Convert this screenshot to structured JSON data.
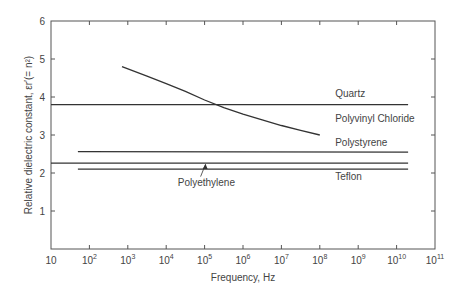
{
  "chart_data": {
    "type": "line",
    "title": "",
    "xlabel": "Frequency, Hz",
    "ylabel": "Relative dielectric constant, εr′(= n²)",
    "xscale": "log",
    "xlim": [
      10,
      100000000000
    ],
    "ylim": [
      0,
      6
    ],
    "grid": false,
    "legend": "inline labels",
    "x_ticks": [
      {
        "value": 1,
        "label": "10",
        "sup": ""
      },
      {
        "value": 2,
        "label": "10",
        "sup": "2"
      },
      {
        "value": 3,
        "label": "10",
        "sup": "3"
      },
      {
        "value": 4,
        "label": "10",
        "sup": "4"
      },
      {
        "value": 5,
        "label": "10",
        "sup": "5"
      },
      {
        "value": 6,
        "label": "10",
        "sup": "6"
      },
      {
        "value": 7,
        "label": "10",
        "sup": "7"
      },
      {
        "value": 8,
        "label": "10",
        "sup": "8"
      },
      {
        "value": 9,
        "label": "10",
        "sup": "9"
      },
      {
        "value": 10,
        "label": "10",
        "sup": "10"
      },
      {
        "value": 11,
        "label": "10",
        "sup": "11"
      }
    ],
    "y_ticks": [
      {
        "value": 1,
        "label": "1"
      },
      {
        "value": 2,
        "label": "2"
      },
      {
        "value": 3,
        "label": "3"
      },
      {
        "value": 4,
        "label": "4"
      },
      {
        "value": 5,
        "label": "5"
      },
      {
        "value": 6,
        "label": "6"
      }
    ],
    "series": [
      {
        "name": "Quartz",
        "log10_x": [
          1.0,
          10.3
        ],
        "y": [
          3.8,
          3.8
        ],
        "label_at": [
          8.4,
          4.0
        ]
      },
      {
        "name": "Polyvinyl Chloride",
        "log10_x": [
          2.85,
          3.5,
          4.0,
          4.5,
          5.0,
          5.5,
          6.0,
          6.5,
          7.0,
          7.5,
          8.0
        ],
        "y": [
          4.8,
          4.55,
          4.35,
          4.15,
          3.92,
          3.72,
          3.55,
          3.4,
          3.25,
          3.12,
          3.0
        ],
        "label_at": [
          8.4,
          3.33
        ]
      },
      {
        "name": "Polystyrene",
        "log10_x": [
          1.7,
          10.3
        ],
        "y": [
          2.56,
          2.55
        ],
        "label_at": [
          8.4,
          2.7
        ]
      },
      {
        "name": "Polyethylene",
        "log10_x": [
          1.0,
          10.3
        ],
        "y": [
          2.26,
          2.26
        ],
        "label_at": [
          4.3,
          1.65
        ]
      },
      {
        "name": "Teflon",
        "log10_x": [
          1.7,
          10.3
        ],
        "y": [
          2.1,
          2.1
        ],
        "label_at": [
          8.4,
          1.82
        ]
      }
    ],
    "annotations": [
      {
        "text": "Polyethylene",
        "arrow_from_log10_x": 5.0,
        "arrow_from_y": 1.8,
        "arrow_to_log10_x": 5.0,
        "arrow_to_y": 2.26
      }
    ]
  }
}
